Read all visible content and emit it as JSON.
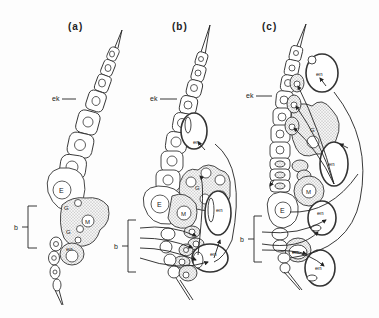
{
  "figure": {
    "panels": [
      {
        "id": "a",
        "label": "(a)",
        "labels": {
          "ectoderm": "ek",
          "cell_E": "E",
          "cell_M": "M",
          "cell_G1": "G",
          "cell_G2": "G",
          "endoderm": "en",
          "bracket": "b"
        }
      },
      {
        "id": "b",
        "label": "(b)",
        "labels": {
          "ectoderm": "ek",
          "cell_E": "E",
          "cell_M": "M",
          "cell_G": "G",
          "endoderm_top": "en",
          "endoderm_mid": "en",
          "endoderm_low": "en",
          "bracket": "b"
        }
      },
      {
        "id": "c",
        "label": "(c)",
        "labels": {
          "ectoderm": "ek",
          "cell_E": "E",
          "cell_M": "M",
          "cell_G": "G",
          "endoderm_top": "en",
          "endoderm_upper": "en",
          "endoderm_mid": "en",
          "endoderm_low1": "en",
          "endoderm_low2": "en",
          "bracket": "b"
        }
      }
    ],
    "colors": {
      "ink": "#222222",
      "background": "#fdfdfd"
    }
  }
}
